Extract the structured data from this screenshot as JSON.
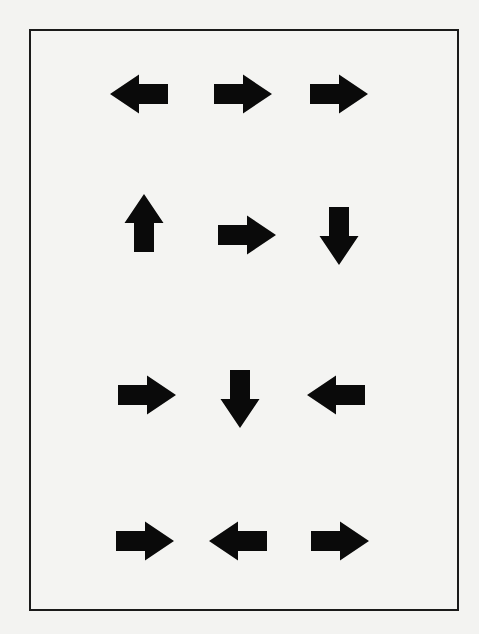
{
  "diagram": {
    "type": "arrow-grid",
    "colors": {
      "background": "#f3f3f1",
      "frame_border": "#1a1a1a",
      "arrow_fill": "#0a0a0a"
    },
    "frame": {
      "x": 29,
      "y": 29,
      "width": 430,
      "height": 582,
      "border_width": 2
    },
    "rows": [
      {
        "index": 1,
        "arrows": [
          {
            "direction": "left",
            "cx": 139,
            "cy": 94
          },
          {
            "direction": "right",
            "cx": 243,
            "cy": 94
          },
          {
            "direction": "right",
            "cx": 339,
            "cy": 94
          }
        ]
      },
      {
        "index": 2,
        "arrows": [
          {
            "direction": "up",
            "cx": 144,
            "cy": 223
          },
          {
            "direction": "right",
            "cx": 247,
            "cy": 235
          },
          {
            "direction": "down",
            "cx": 339,
            "cy": 236
          }
        ]
      },
      {
        "index": 3,
        "arrows": [
          {
            "direction": "right",
            "cx": 147,
            "cy": 395
          },
          {
            "direction": "down",
            "cx": 240,
            "cy": 399
          },
          {
            "direction": "left",
            "cx": 336,
            "cy": 395
          }
        ]
      },
      {
        "index": 4,
        "arrows": [
          {
            "direction": "right",
            "cx": 145,
            "cy": 541
          },
          {
            "direction": "left",
            "cx": 238,
            "cy": 541
          },
          {
            "direction": "right",
            "cx": 340,
            "cy": 541
          }
        ]
      }
    ]
  }
}
